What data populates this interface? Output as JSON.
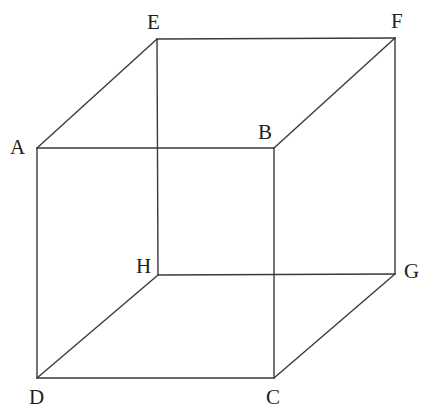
{
  "figure": {
    "name": "cube-diagram",
    "type": "geometric-solid",
    "shape": "cube",
    "background_color": "#ffffff",
    "line_color": "#3a3a3a",
    "line_width": 1.4,
    "label_color": "#1f1f1f",
    "vertices": [
      {
        "id": "A",
        "label": "A",
        "x": 37,
        "y": 148,
        "label_x": 10,
        "label_y": 137,
        "hidden": false
      },
      {
        "id": "B",
        "label": "B",
        "x": 274,
        "y": 148,
        "label_x": 258,
        "label_y": 122,
        "hidden": false
      },
      {
        "id": "C",
        "label": "C",
        "x": 274,
        "y": 378,
        "label_x": 266,
        "label_y": 387,
        "hidden": false
      },
      {
        "id": "D",
        "label": "D",
        "x": 37,
        "y": 378,
        "label_x": 29,
        "label_y": 387,
        "hidden": false
      },
      {
        "id": "E",
        "label": "E",
        "x": 157,
        "y": 39,
        "label_x": 147,
        "label_y": 12,
        "hidden": false
      },
      {
        "id": "F",
        "label": "F",
        "x": 395,
        "y": 38,
        "label_x": 391,
        "label_y": 11,
        "hidden": false
      },
      {
        "id": "G",
        "label": "G",
        "x": 395,
        "y": 274,
        "label_x": 404,
        "label_y": 261,
        "hidden": false
      },
      {
        "id": "H",
        "label": "H",
        "x": 158,
        "y": 275,
        "label_x": 136,
        "label_y": 256,
        "hidden": false
      }
    ],
    "edges": [
      {
        "id": "AB",
        "from": "A",
        "to": "B",
        "style": "solid"
      },
      {
        "id": "BC",
        "from": "B",
        "to": "C",
        "style": "solid"
      },
      {
        "id": "CD",
        "from": "C",
        "to": "D",
        "style": "solid"
      },
      {
        "id": "DA",
        "from": "D",
        "to": "A",
        "style": "solid"
      },
      {
        "id": "EF",
        "from": "E",
        "to": "F",
        "style": "solid"
      },
      {
        "id": "FG",
        "from": "F",
        "to": "G",
        "style": "solid"
      },
      {
        "id": "GH",
        "from": "G",
        "to": "H",
        "style": "solid"
      },
      {
        "id": "HE",
        "from": "H",
        "to": "E",
        "style": "solid"
      },
      {
        "id": "AE",
        "from": "A",
        "to": "E",
        "style": "solid"
      },
      {
        "id": "BF",
        "from": "B",
        "to": "F",
        "style": "solid"
      },
      {
        "id": "CG",
        "from": "C",
        "to": "G",
        "style": "solid"
      },
      {
        "id": "DH",
        "from": "D",
        "to": "H",
        "style": "solid"
      }
    ]
  }
}
